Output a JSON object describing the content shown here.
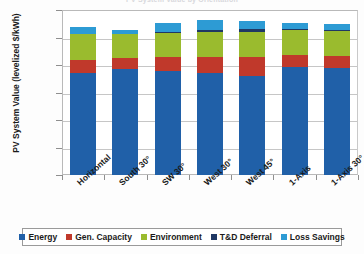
{
  "chart_data": {
    "type": "bar",
    "subtype": "stacked-column",
    "title": "PV System Value by Orientation",
    "xlabel": "",
    "ylabel": "PV System Value  (levelized $/kWh)",
    "ylim": [
      0.0,
      0.15
    ],
    "ytick_values": [
      0.15,
      0.125,
      0.1,
      0.075,
      0.05,
      0.025,
      0.0
    ],
    "ytick_labels": [
      "$0.150",
      "$0.125",
      "$0.100",
      "$0.075",
      "$0.050",
      "$0.025",
      "$0.000"
    ],
    "grid": true,
    "legend_position": "bottom",
    "categories": [
      "Horizontal",
      "South 30°",
      "SW 30°",
      "West 30°",
      "West 45°",
      "1-Axis",
      "1-Axis 30°"
    ],
    "series": [
      {
        "name": "Energy",
        "color": "#2060A8",
        "values": [
          0.0925,
          0.096,
          0.0945,
          0.0925,
          0.09,
          0.0985,
          0.0975
        ]
      },
      {
        "name": "Gen. Capacity",
        "color": "#C0392B",
        "values": [
          0.0125,
          0.0105,
          0.0125,
          0.0145,
          0.0175,
          0.0105,
          0.011
        ]
      },
      {
        "name": "Environment",
        "color": "#9ABB2E",
        "values": [
          0.023,
          0.0215,
          0.0225,
          0.023,
          0.0225,
          0.023,
          0.0225
        ]
      },
      {
        "name": "T&D Deferral",
        "color": "#1F3864",
        "values": [
          0.0005,
          0.0005,
          0.0008,
          0.002,
          0.0028,
          0.0008,
          0.0005
        ]
      },
      {
        "name": "Loss Savings",
        "color": "#2D9BD4",
        "values": [
          0.006,
          0.0035,
          0.0075,
          0.0085,
          0.0075,
          0.0055,
          0.006
        ]
      }
    ],
    "totals": [
      0.1345,
      0.132,
      0.1378,
      0.1405,
      0.1403,
      0.1383,
      0.1375
    ]
  },
  "legend": {
    "items": [
      {
        "label": "Energy",
        "color": "#2060A8"
      },
      {
        "label": "Gen. Capacity",
        "color": "#C0392B"
      },
      {
        "label": "Environment",
        "color": "#9ABB2E"
      },
      {
        "label": "T&D Deferral",
        "color": "#1F3864"
      },
      {
        "label": "Loss Savings",
        "color": "#2D9BD4"
      }
    ]
  }
}
